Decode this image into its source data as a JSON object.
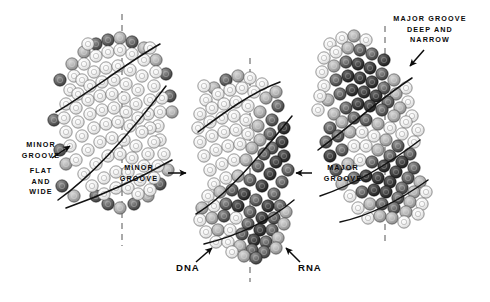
{
  "figure": {
    "background_color": "#ffffff",
    "ink_color": "#0b0b0b"
  },
  "annotations": {
    "left_minor_groove": {
      "line1": "MINOR",
      "line2": "GROOVE",
      "arrow": "arrow-up-right"
    },
    "left_descriptor": {
      "line1": "FLAT",
      "line2": "AND",
      "line3": "WIDE"
    },
    "center_minor_groove": {
      "line1": "MINOR",
      "line2": "GROOVE",
      "arrow": "arrow-right"
    },
    "center_major_groove": {
      "line1": "MAJOR",
      "line2": "GROOVE",
      "arrow": "arrow-left"
    },
    "right_major_groove": {
      "line1": "MAJOR GROOVE",
      "line2": "DEEP AND",
      "line3": "NARROW",
      "arrow": "arrow-down-left"
    },
    "dna_label": {
      "text": "DNA",
      "arrow": "arrow-up-right"
    },
    "rna_label": {
      "text": "RNA",
      "arrow": "arrow-up-left"
    }
  },
  "structures": [
    {
      "id": "left",
      "name": "DNA duplex (B-form)",
      "shading": "light",
      "axis": "vertical-dashed"
    },
    {
      "id": "center",
      "name": "DNA-RNA hybrid duplex",
      "shading": "mixed",
      "axis": "vertical-dashed"
    },
    {
      "id": "right",
      "name": "RNA duplex (A-form)",
      "shading": "dark",
      "axis": "vertical-dashed"
    }
  ]
}
